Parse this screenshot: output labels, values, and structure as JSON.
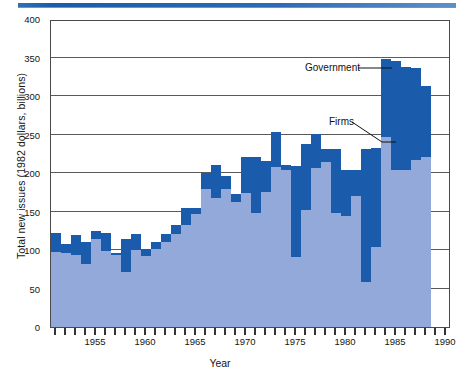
{
  "figure": {
    "title": "",
    "ytitle": "Total new issues (1982 dollars, billions)",
    "xtitle": "Year"
  },
  "annotations": {
    "government": "Government",
    "firms": "Firms"
  },
  "colors": {
    "firms": "#93a9d9",
    "government": "#1a5cab",
    "axis": "#4a4a4a",
    "rule": "#1a5cab"
  },
  "chart_data": {
    "type": "bar",
    "stacked": true,
    "title": "",
    "xlabel": "Year",
    "ylabel": "Total new issues (1982 dollars, billions)",
    "xlim": [
      1950.5,
      1990.5
    ],
    "ylim": [
      0,
      400
    ],
    "yticks": [
      0,
      50,
      100,
      150,
      200,
      250,
      300,
      350,
      400
    ],
    "ytick_labels": [
      "0",
      "50",
      "100",
      "150",
      "200",
      "250",
      "300",
      "350",
      "400"
    ],
    "xticks": [
      1951,
      1952,
      1953,
      1954,
      1955,
      1956,
      1957,
      1958,
      1959,
      1960,
      1961,
      1962,
      1963,
      1964,
      1965,
      1966,
      1967,
      1968,
      1969,
      1970,
      1971,
      1972,
      1973,
      1974,
      1975,
      1976,
      1977,
      1978,
      1979,
      1980,
      1981,
      1982,
      1983,
      1984,
      1985,
      1986,
      1987,
      1988,
      1989,
      1990
    ],
    "xtick_labels_shown": [
      "1955",
      "1960",
      "1965",
      "1970",
      "1975",
      "1980",
      "1985",
      "1990"
    ],
    "grid": "horizontal",
    "legend_position": "annotations",
    "categories": [
      1951,
      1952,
      1953,
      1954,
      1955,
      1956,
      1957,
      1958,
      1959,
      1960,
      1961,
      1962,
      1963,
      1964,
      1965,
      1966,
      1967,
      1968,
      1969,
      1970,
      1971,
      1972,
      1973,
      1974,
      1975,
      1976,
      1977,
      1978,
      1979,
      1980,
      1981,
      1982,
      1983,
      1984,
      1985,
      1986,
      1987,
      1988
    ],
    "series": [
      {
        "name": "Firms",
        "color": "#93a9d9",
        "values": [
          97,
          96,
          93,
          82,
          114,
          99,
          94,
          71,
          100,
          92,
          101,
          111,
          121,
          133,
          147,
          179,
          168,
          179,
          163,
          174,
          148,
          175,
          208,
          204,
          91,
          152,
          207,
          214,
          148,
          144,
          170,
          59,
          104,
          247,
          204,
          204,
          217,
          221
        ]
      },
      {
        "name": "Government",
        "color": "#1a5cab",
        "values": [
          25,
          12,
          26,
          29,
          11,
          23,
          2,
          43,
          21,
          9,
          10,
          10,
          12,
          21,
          7,
          21,
          42,
          17,
          10,
          47,
          73,
          41,
          45,
          6,
          118,
          86,
          44,
          17,
          83,
          60,
          34,
          172,
          128,
          101,
          142,
          134,
          120,
          92
        ]
      }
    ],
    "totals": [
      122,
      108,
      119,
      111,
      125,
      122,
      96,
      114,
      121,
      101,
      111,
      121,
      133,
      154,
      154,
      200,
      210,
      196,
      173,
      221,
      221,
      216,
      253,
      210,
      209,
      238,
      251,
      231,
      231,
      204,
      204,
      231,
      232,
      348,
      346,
      338,
      337,
      313
    ]
  }
}
